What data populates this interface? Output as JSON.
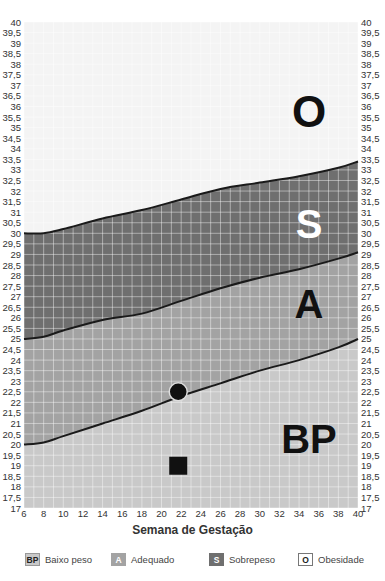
{
  "chart_data": {
    "type": "area",
    "title": "",
    "xlabel": "Semana de Gestação",
    "ylabel": "",
    "xlim": [
      6,
      40
    ],
    "ylim": [
      17,
      40
    ],
    "grid": true,
    "x_ticks": [
      "6",
      "8",
      "10",
      "12",
      "14",
      "16",
      "18",
      "20",
      "22",
      "24",
      "26",
      "28",
      "30",
      "32",
      "34",
      "36",
      "38",
      "40"
    ],
    "y_ticks": [
      "17",
      "17,5",
      "18",
      "18,5",
      "19",
      "19,5",
      "20",
      "20,5",
      "21",
      "21,5",
      "22",
      "22,5",
      "23",
      "23,5",
      "24",
      "24,5",
      "25",
      "25,5",
      "26",
      "26,5",
      "27",
      "27,5",
      "28",
      "28,5",
      "29",
      "29,5",
      "30",
      "30,5",
      "31",
      "31,5",
      "32",
      "32,5",
      "33",
      "33,5",
      "34",
      "34,5",
      "35",
      "35,5",
      "36",
      "36,5",
      "37",
      "37,5",
      "38",
      "38,5",
      "39",
      "39,5",
      "40"
    ],
    "boundaries": [
      {
        "name": "BP/A",
        "x": [
          6,
          8,
          10,
          14,
          18,
          22,
          26,
          30,
          34,
          38,
          40
        ],
        "y": [
          20.0,
          20.1,
          20.4,
          21.0,
          21.6,
          22.3,
          22.9,
          23.5,
          24.0,
          24.6,
          25.0
        ]
      },
      {
        "name": "A/S",
        "x": [
          6,
          8,
          10,
          14,
          18,
          22,
          26,
          30,
          34,
          38,
          40
        ],
        "y": [
          25.0,
          25.1,
          25.4,
          25.9,
          26.2,
          26.8,
          27.4,
          27.9,
          28.3,
          28.8,
          29.1
        ]
      },
      {
        "name": "S/O",
        "x": [
          6,
          8,
          10,
          14,
          18,
          22,
          26,
          30,
          34,
          38,
          40
        ],
        "y": [
          30.0,
          30.0,
          30.2,
          30.7,
          31.1,
          31.6,
          32.1,
          32.4,
          32.7,
          33.1,
          33.4
        ]
      }
    ],
    "zones": [
      {
        "code": "BP",
        "label": "Baixo peso"
      },
      {
        "code": "A",
        "label": "Adequado"
      },
      {
        "code": "S",
        "label": "Sobrepeso"
      },
      {
        "code": "O",
        "label": "Obesidade"
      }
    ],
    "markers": [
      {
        "shape": "circle",
        "x": 21.7,
        "y": 22.5
      },
      {
        "shape": "square",
        "x": 21.7,
        "y": 19.0
      }
    ],
    "legend_position": "bottom"
  },
  "colors": {
    "BP": "#c9c9c9",
    "A": "#a3a3a3",
    "S": "#6f6f6f",
    "O": "#ffffff",
    "line": "#1a1a1a"
  },
  "legend": [
    {
      "code": "BP",
      "label": "Baixo peso"
    },
    {
      "code": "A",
      "label": "Adequado"
    },
    {
      "code": "S",
      "label": "Sobrepeso"
    },
    {
      "code": "O",
      "label": "Obesidade"
    }
  ]
}
